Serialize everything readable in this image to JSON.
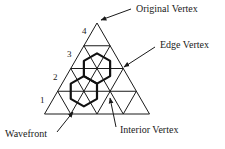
{
  "diagram": {
    "type": "triangular-mesh-subdivision",
    "colors": {
      "line": "#1a1a1a",
      "hex": "#111111",
      "background": "#ffffff"
    },
    "triangle": {
      "apex": [
        97,
        23
      ],
      "base_left": [
        43,
        114
      ],
      "base_right": [
        148,
        114
      ],
      "subdivisions": 4
    },
    "level_labels": [
      {
        "text": "1",
        "x": 40,
        "y": 103
      },
      {
        "text": "2",
        "x": 53,
        "y": 80
      },
      {
        "text": "3",
        "x": 67,
        "y": 57
      },
      {
        "text": "4",
        "x": 82,
        "y": 34
      }
    ],
    "hexagons": [
      {
        "name": "upper",
        "center_row": 2,
        "center_index": 1
      },
      {
        "name": "lower",
        "center_row": 3,
        "center_index": 1
      }
    ],
    "callouts": [
      {
        "id": "original-vertex",
        "text": "Original Vertex",
        "text_x": 136,
        "text_y": 12,
        "arrow_from": [
          131,
          9
        ],
        "arrow_to": [
          101,
          20
        ]
      },
      {
        "id": "edge-vertex",
        "text": "Edge Vertex",
        "text_x": 160,
        "text_y": 48,
        "arrow_from": [
          155,
          47
        ],
        "arrow_to": [
          124,
          67
        ]
      },
      {
        "id": "wavefront",
        "text": "Wavefront",
        "text_x": 5,
        "text_y": 137,
        "arrow_from": [
          57,
          132
        ],
        "arrow_to": [
          73,
          112
        ]
      },
      {
        "id": "interior-vertex",
        "text": "Interior Vertex",
        "text_x": 120,
        "text_y": 133,
        "arrow_from": [
          116,
          127
        ],
        "arrow_to": [
          110,
          98
        ]
      }
    ]
  }
}
